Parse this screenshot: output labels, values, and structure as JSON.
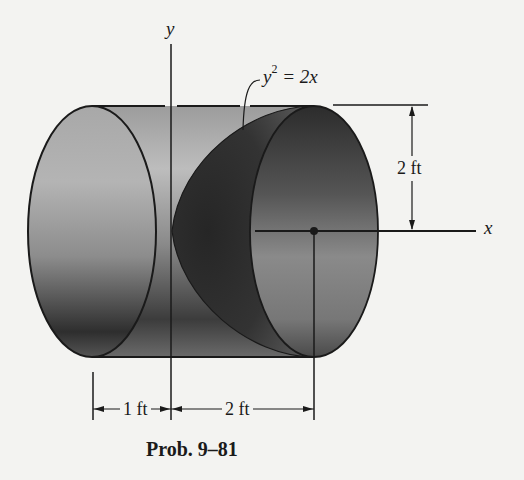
{
  "figure": {
    "caption": "Prob. 9–81",
    "axes": {
      "y_label": "y",
      "x_label": "x"
    },
    "equation": {
      "base": "y",
      "exponent": "2",
      "rhs": " = 2x"
    },
    "dimensions": {
      "radius": "2 ft",
      "left_length": "1 ft",
      "right_length": "2 ft"
    },
    "colors": {
      "background": "#f3f3f1",
      "line": "#1a1a1a",
      "cylinder_light": "#b8b8b8",
      "cylinder_dark": "#3a3a3a",
      "paraboloid_dark": "#2a2a2a"
    }
  }
}
